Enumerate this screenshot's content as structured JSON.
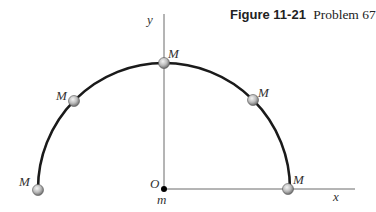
{
  "caption": {
    "figure_number": "Figure 11-21",
    "title": "Problem 67"
  },
  "axes": {
    "x_label": "x",
    "y_label": "y",
    "origin_label": "O",
    "origin_mass_label": "m"
  },
  "arc": {
    "shape": "semicircle",
    "center": "origin",
    "color": "#1a1a1a"
  },
  "masses": [
    {
      "label": "M",
      "angle_deg": 180
    },
    {
      "label": "M",
      "angle_deg": 135
    },
    {
      "label": "M",
      "angle_deg": 90
    },
    {
      "label": "M",
      "angle_deg": 45
    },
    {
      "label": "M",
      "angle_deg": 0
    }
  ],
  "colors": {
    "axis": "#6b6b6b",
    "arc": "#1a1a1a",
    "ball_fill": "#b8b8b8",
    "ball_highlight": "#f2f2f2",
    "origin_dot": "#000000"
  }
}
